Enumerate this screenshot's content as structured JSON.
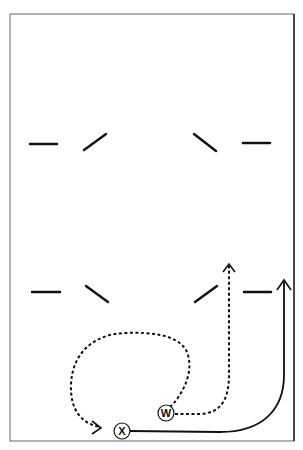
{
  "diagram": {
    "type": "football-play-diagram",
    "colors": {
      "line": "#111111",
      "frame": "#9a9a9a",
      "background": "#ffffff"
    },
    "frame": {
      "x": 10,
      "y": 14,
      "width": 284,
      "height": 427
    },
    "players": [
      {
        "id": "X",
        "label": "X",
        "cx": 122,
        "cy": 431,
        "r": 8
      },
      {
        "id": "W",
        "label": "W",
        "cx": 166,
        "cy": 413,
        "r": 8
      }
    ],
    "defenders_row1": [
      {
        "x1": 30,
        "y1": 144,
        "x2": 57,
        "y2": 144
      },
      {
        "x1": 84,
        "y1": 150,
        "x2": 106,
        "y2": 134
      },
      {
        "x1": 194,
        "y1": 134,
        "x2": 216,
        "y2": 151
      },
      {
        "x1": 243,
        "y1": 143,
        "x2": 270,
        "y2": 143
      }
    ],
    "defenders_row2": [
      {
        "x1": 32,
        "y1": 292,
        "x2": 60,
        "y2": 292
      },
      {
        "x1": 86,
        "y1": 286,
        "x2": 108,
        "y2": 302
      },
      {
        "x1": 195,
        "y1": 302,
        "x2": 217,
        "y2": 286
      },
      {
        "x1": 244,
        "y1": 292,
        "x2": 271,
        "y2": 292
      }
    ],
    "routes": [
      {
        "name": "w-loop-route",
        "style": "dashed",
        "d": "M 170 407 C 182 396, 196 370, 186 350 C 176 334, 150 332, 125 333 C 95 334, 72 352, 71 385 C 70 410, 82 424, 100 427"
      },
      {
        "name": "w-vertical-route",
        "style": "dashed",
        "d": "M 175 414 L 200 414 C 222 413, 229 398, 229 375 L 229 265"
      },
      {
        "name": "x-wheel-route",
        "style": "solid",
        "d": "M 130 431 L 220 432 C 262 432, 284 410, 284 375 L 284 282"
      }
    ]
  }
}
